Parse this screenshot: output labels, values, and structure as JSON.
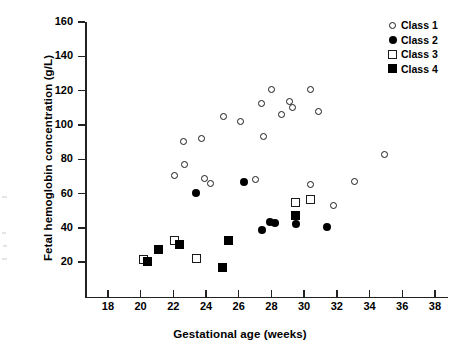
{
  "chart_data": {
    "type": "scatter",
    "title": "",
    "xlabel": "Gestational age (weeks)",
    "ylabel": "Fetal hemoglobin concentration (g/L)",
    "xlim": [
      16.6,
      38.8
    ],
    "ylim": [
      0,
      160
    ],
    "xticks": [
      18,
      20,
      22,
      24,
      26,
      28,
      30,
      32,
      34,
      36,
      38
    ],
    "yticks": [
      20,
      40,
      60,
      80,
      100,
      120,
      140,
      160
    ],
    "grid": false,
    "legend_position": "top-right",
    "series": [
      {
        "name": "Class 1",
        "marker": "open-circle",
        "color": "#1a1a1a",
        "points": [
          [
            22.1,
            70.5
          ],
          [
            22.6,
            90.5
          ],
          [
            22.7,
            77.0
          ],
          [
            23.7,
            92.0
          ],
          [
            23.9,
            68.5
          ],
          [
            24.3,
            66.0
          ],
          [
            25.1,
            105.0
          ],
          [
            26.1,
            102.0
          ],
          [
            27.0,
            68.0
          ],
          [
            27.4,
            112.5
          ],
          [
            27.5,
            93.0
          ],
          [
            28.0,
            120.5
          ],
          [
            28.6,
            106.0
          ],
          [
            29.1,
            113.5
          ],
          [
            29.3,
            110.0
          ],
          [
            30.4,
            120.5
          ],
          [
            30.4,
            65.5
          ],
          [
            30.9,
            108.0
          ],
          [
            31.8,
            53.0
          ],
          [
            33.1,
            67.0
          ],
          [
            34.9,
            83.0
          ]
        ]
      },
      {
        "name": "Class 2",
        "marker": "filled-circle",
        "color": "#000000",
        "points": [
          [
            23.4,
            60.5
          ],
          [
            26.3,
            66.5
          ],
          [
            27.4,
            38.5
          ],
          [
            27.9,
            43.5
          ],
          [
            28.2,
            43.0
          ],
          [
            29.5,
            42.0
          ],
          [
            31.4,
            40.5
          ]
        ]
      },
      {
        "name": "Class 3",
        "marker": "open-square",
        "color": "#1a1a1a",
        "points": [
          [
            20.2,
            21.5
          ],
          [
            22.1,
            32.5
          ],
          [
            23.4,
            22.0
          ],
          [
            29.5,
            55.0
          ],
          [
            30.4,
            56.5
          ]
        ]
      },
      {
        "name": "Class 4",
        "marker": "filled-square",
        "color": "#000000",
        "points": [
          [
            20.4,
            20.5
          ],
          [
            21.1,
            27.5
          ],
          [
            22.4,
            30.5
          ],
          [
            25.0,
            17.0
          ],
          [
            25.4,
            32.5
          ],
          [
            29.5,
            47.5
          ]
        ]
      }
    ]
  },
  "legend": {
    "items": [
      {
        "label": "Class 1",
        "marker": "open-circle"
      },
      {
        "label": "Class 2",
        "marker": "filled-circle"
      },
      {
        "label": "Class 3",
        "marker": "open-square"
      },
      {
        "label": "Class 4",
        "marker": "filled-square"
      }
    ]
  }
}
